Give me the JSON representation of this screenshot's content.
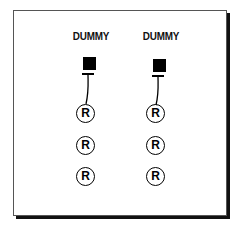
{
  "diagram": {
    "columns": [
      {
        "label": "DUMMY",
        "symbols": [
          "R",
          "R",
          "R"
        ]
      },
      {
        "label": "DUMMY",
        "symbols": [
          "R",
          "R",
          "R"
        ]
      }
    ]
  }
}
